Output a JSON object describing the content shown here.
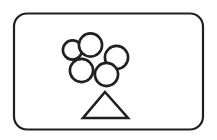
{
  "canvas": {
    "width": 217,
    "height": 140,
    "background_color": "#ffffff"
  },
  "card": {
    "title": "balloon-cluster-pictogram",
    "shape": "rounded-rectangle",
    "x": 14,
    "y": 13.5,
    "width": 189,
    "height": 116,
    "corner_radius": 13,
    "stroke_color": "#231f20",
    "stroke_width": 2.2,
    "fill_color": "#ffffff"
  },
  "figure": {
    "name": "balloons-over-triangle",
    "stroke_color": "#231f20",
    "fill_color": "#ffffff",
    "circles": [
      {
        "name": "balloon-left",
        "cx": 72.5,
        "cy": 50.0,
        "r": 9.6,
        "stroke_width": 2.6
      },
      {
        "name": "balloon-top",
        "cx": 90.5,
        "cy": 45.0,
        "r": 11.6,
        "stroke_width": 2.6
      },
      {
        "name": "balloon-right",
        "cx": 116.5,
        "cy": 57.5,
        "r": 11.6,
        "stroke_width": 2.6
      },
      {
        "name": "balloon-bottom-left",
        "cx": 81.5,
        "cy": 70.5,
        "r": 11.6,
        "stroke_width": 2.6
      },
      {
        "name": "balloon-bottom-right",
        "cx": 106.5,
        "cy": 74.5,
        "r": 11.6,
        "stroke_width": 2.6
      }
    ],
    "triangle": {
      "name": "triangle-base",
      "apex_x": 105,
      "apex_y": 92,
      "left_x": 83,
      "right_x": 128,
      "base_y": 118,
      "stroke_width": 2.6
    }
  },
  "accessibility": {
    "alt_text": "Outlined drawing of five overlapping circles resting on a triangle"
  },
  "colors": {
    "ink": "#231f20",
    "paper": "#ffffff"
  }
}
